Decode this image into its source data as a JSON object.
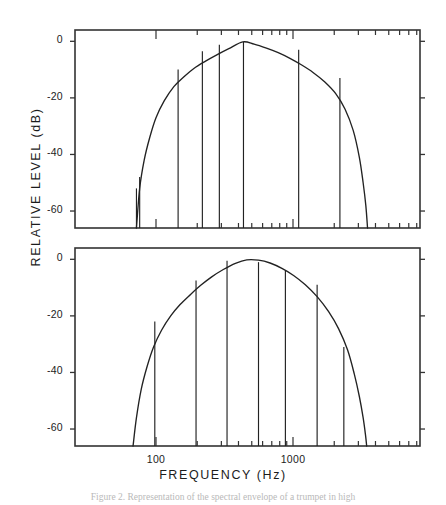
{
  "figure": {
    "axis_label_y": "RELATIVE  LEVEL   (dB)",
    "axis_label_x": "FREQUENCY   (Hz)",
    "caption": "Figure 2. Representation of the spectral envelope of a trumpet in high",
    "line_color": "#222222",
    "frame_color": "#333333",
    "background": "#ffffff"
  },
  "chart_data": {
    "type": "line",
    "title": "",
    "xlabel": "FREQUENCY  (Hz)",
    "ylabel": "RELATIVE LEVEL  (dB)",
    "x_scale": "log",
    "xlim": [
      40,
      6000
    ],
    "ylim": [
      -66,
      4
    ],
    "grid": false,
    "legend": "none",
    "x_tick_labels": [
      "100",
      "1000"
    ],
    "x_tick_values": [
      100,
      1000
    ],
    "y_tick_labels": [
      "0",
      "-20",
      "-40",
      "-60"
    ],
    "y_tick_values": [
      0,
      -20,
      -40,
      -60
    ],
    "panels": [
      {
        "name": "upper-panel",
        "envelope_peak_freq_hz": 430,
        "envelope_peak_level_db": 0,
        "envelope": {
          "x": [
            72,
            76,
            82,
            90,
            100,
            115,
            135,
            160,
            190,
            230,
            280,
            340,
            430,
            520,
            640,
            780,
            950,
            1150,
            1400,
            1700,
            2050,
            2400,
            2750,
            3050,
            3250,
            3400,
            3500
          ],
          "y": [
            -66,
            -52,
            -42,
            -34,
            -27,
            -21,
            -16,
            -12.5,
            -9.5,
            -7,
            -4.7,
            -2.6,
            -0.2,
            -1.0,
            -2.4,
            -4.0,
            -6.0,
            -8.3,
            -11.0,
            -14.3,
            -18.5,
            -24.0,
            -31.5,
            -41.0,
            -50.0,
            -58.0,
            -66
          ]
        },
        "harmonics": [
          {
            "freq_hz": 72,
            "level_db": -52
          },
          {
            "freq_hz": 76,
            "level_db": -48
          },
          {
            "freq_hz": 145,
            "level_db": -10
          },
          {
            "freq_hz": 218,
            "level_db": -3.5
          },
          {
            "freq_hz": 290,
            "level_db": -1.2
          },
          {
            "freq_hz": 435,
            "level_db": -0.2
          },
          {
            "freq_hz": 1100,
            "level_db": -3.0
          },
          {
            "freq_hz": 2200,
            "level_db": -13.0
          }
        ]
      },
      {
        "name": "lower-panel",
        "envelope_peak_freq_hz": 430,
        "envelope_peak_level_db": 0,
        "envelope": {
          "x": [
            68,
            72,
            78,
            86,
            96,
            110,
            128,
            150,
            178,
            212,
            255,
            310,
            380,
            460,
            560,
            680,
            830,
            1010,
            1230,
            1500,
            1820,
            2150,
            2500,
            2800,
            3050,
            3250,
            3380,
            3450
          ],
          "y": [
            -66,
            -56,
            -46,
            -38,
            -31,
            -25,
            -20,
            -16,
            -12.5,
            -9.2,
            -6.2,
            -3.6,
            -1.4,
            -0.2,
            -0.3,
            -1.3,
            -3.2,
            -5.7,
            -9.0,
            -13.2,
            -18.5,
            -24.5,
            -32.0,
            -40.5,
            -48.5,
            -56.0,
            -62.0,
            -66
          ]
        },
        "harmonics": [
          {
            "freq_hz": 72,
            "level_db": -66
          },
          {
            "freq_hz": 98,
            "level_db": -22
          },
          {
            "freq_hz": 196,
            "level_db": -7.5
          },
          {
            "freq_hz": 330,
            "level_db": -0.5
          },
          {
            "freq_hz": 560,
            "level_db": -1.0
          },
          {
            "freq_hz": 880,
            "level_db": -4.0
          },
          {
            "freq_hz": 1500,
            "level_db": -9.0
          },
          {
            "freq_hz": 2350,
            "level_db": -31.0
          }
        ]
      }
    ]
  }
}
